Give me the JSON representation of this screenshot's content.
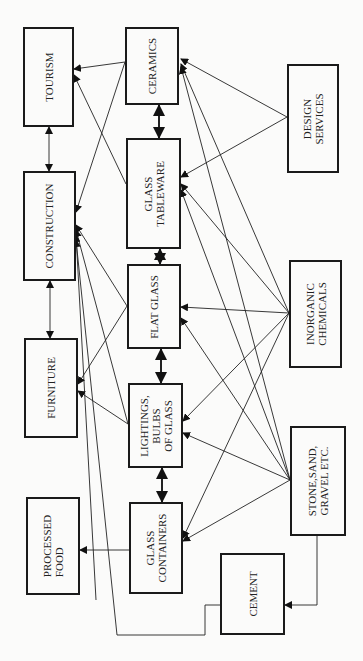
{
  "diagram": {
    "orientation": "rotated-90-ccw",
    "nodes": [
      {
        "id": "tourism",
        "label": "TOURISM",
        "x": 23,
        "y": 27,
        "w": 51,
        "h": 100
      },
      {
        "id": "construction",
        "label": "CONSTRUCTION",
        "x": 23,
        "y": 171,
        "w": 53,
        "h": 110
      },
      {
        "id": "furniture",
        "label": "FURNITURE",
        "x": 24,
        "y": 338,
        "w": 54,
        "h": 100
      },
      {
        "id": "processed_food",
        "label": "PROCESSED\nFOOD",
        "x": 26,
        "y": 497,
        "w": 54,
        "h": 98
      },
      {
        "id": "ceramics",
        "label": "CERAMICS",
        "x": 125,
        "y": 27,
        "w": 54,
        "h": 78
      },
      {
        "id": "glass_tableware",
        "label": "GLASS\nTABLEWARE",
        "x": 126,
        "y": 138,
        "w": 55,
        "h": 111
      },
      {
        "id": "flat_glass",
        "label": "FLAT GLASS",
        "x": 127,
        "y": 264,
        "w": 54,
        "h": 85
      },
      {
        "id": "lightings",
        "label": "LIGHTINGS,\nBULBS\nOF GLASS",
        "x": 128,
        "y": 383,
        "w": 55,
        "h": 85
      },
      {
        "id": "glass_containers",
        "label": "GLASS\nCONTAINERS",
        "x": 129,
        "y": 502,
        "w": 54,
        "h": 92
      },
      {
        "id": "design_services",
        "label": "DESIGN\nSERVICES",
        "x": 287,
        "y": 64,
        "w": 52,
        "h": 109
      },
      {
        "id": "inorganic_chemicals",
        "label": "INORGANIC\nCHEMICALS",
        "x": 289,
        "y": 260,
        "w": 53,
        "h": 108
      },
      {
        "id": "stone_sand",
        "label": "STONE,SAND,\nGRAVEL ETC.",
        "x": 290,
        "y": 426,
        "w": 56,
        "h": 110
      },
      {
        "id": "cement",
        "label": "CEMENT",
        "x": 220,
        "y": 553,
        "w": 65,
        "h": 82
      }
    ],
    "edges": [
      {
        "from": "tourism",
        "to": "construction",
        "type": "bidirectional"
      },
      {
        "from": "construction",
        "to": "furniture",
        "type": "bidirectional"
      },
      {
        "from": "ceramics",
        "to": "glass_tableware",
        "type": "bidirectional-bold"
      },
      {
        "from": "glass_tableware",
        "to": "flat_glass",
        "type": "bidirectional-bold"
      },
      {
        "from": "flat_glass",
        "to": "lightings",
        "type": "bidirectional-bold"
      },
      {
        "from": "lightings",
        "to": "glass_containers",
        "type": "bidirectional-bold"
      },
      {
        "from": "ceramics",
        "to": "tourism",
        "type": "arrow"
      },
      {
        "from": "glass_tableware",
        "to": "tourism",
        "type": "arrow"
      },
      {
        "from": "ceramics",
        "to": "construction",
        "type": "arrow"
      },
      {
        "from": "flat_glass",
        "to": "construction",
        "type": "arrow"
      },
      {
        "from": "lightings",
        "to": "construction",
        "type": "arrow"
      },
      {
        "from": "glass_containers",
        "to": "construction",
        "type": "arrow"
      },
      {
        "from": "cement",
        "to": "construction",
        "type": "arrow"
      },
      {
        "from": "flat_glass",
        "to": "furniture",
        "type": "arrow"
      },
      {
        "from": "lightings",
        "to": "furniture",
        "type": "arrow"
      },
      {
        "from": "glass_containers",
        "to": "processed_food",
        "type": "arrow"
      },
      {
        "from": "design_services",
        "to": "ceramics",
        "type": "arrow"
      },
      {
        "from": "design_services",
        "to": "glass_tableware",
        "type": "arrow"
      },
      {
        "from": "inorganic_chemicals",
        "to": "ceramics",
        "type": "arrow"
      },
      {
        "from": "inorganic_chemicals",
        "to": "glass_tableware",
        "type": "arrow"
      },
      {
        "from": "inorganic_chemicals",
        "to": "flat_glass",
        "type": "arrow"
      },
      {
        "from": "inorganic_chemicals",
        "to": "lightings",
        "type": "arrow"
      },
      {
        "from": "inorganic_chemicals",
        "to": "glass_containers",
        "type": "arrow"
      },
      {
        "from": "stone_sand",
        "to": "ceramics",
        "type": "arrow"
      },
      {
        "from": "stone_sand",
        "to": "glass_tableware",
        "type": "arrow"
      },
      {
        "from": "stone_sand",
        "to": "flat_glass",
        "type": "arrow"
      },
      {
        "from": "stone_sand",
        "to": "lightings",
        "type": "arrow"
      },
      {
        "from": "stone_sand",
        "to": "glass_containers",
        "type": "arrow"
      },
      {
        "from": "stone_sand",
        "to": "cement",
        "type": "arrow"
      }
    ]
  }
}
